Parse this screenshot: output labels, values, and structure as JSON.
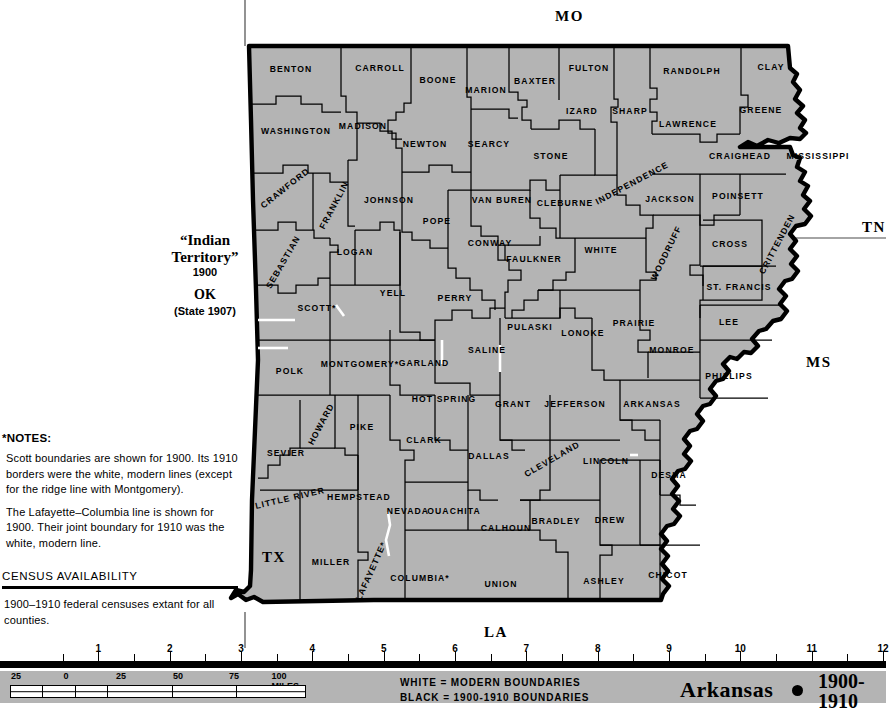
{
  "map": {
    "title": "Arkansas",
    "period": "1900-1910",
    "period_line1": "1900-",
    "period_line2": "1910",
    "fill_color": "#b4b4b4",
    "boundary_color": "#000000",
    "modern_line_color": "#ffffff",
    "legend": {
      "line1": "WHITE = MODERN BOUNDARIES",
      "line2": "BLACK = 1900-1910 BOUNDARIES"
    },
    "neighbor_states": [
      {
        "label": "MO",
        "x": 555,
        "y": 8
      },
      {
        "label": "TN",
        "x": 862,
        "y": 219
      },
      {
        "label": "MS",
        "x": 806,
        "y": 354
      },
      {
        "label": "TX",
        "x": 262,
        "y": 549
      },
      {
        "label": "LA",
        "x": 484,
        "y": 624
      }
    ],
    "indian_territory": {
      "line1": "“Indian",
      "line2": "Territory”",
      "year": "1900",
      "abbrev": "OK",
      "statehood": "(State 1907)"
    },
    "counties": [
      {
        "name": "BENTON",
        "x": 291,
        "y": 69,
        "rot": 0
      },
      {
        "name": "CARROLL",
        "x": 380,
        "y": 68,
        "rot": 0
      },
      {
        "name": "BOONE",
        "x": 438,
        "y": 80,
        "rot": 0
      },
      {
        "name": "MARION",
        "x": 486,
        "y": 90,
        "rot": 0
      },
      {
        "name": "BAXTER",
        "x": 535,
        "y": 81,
        "rot": 0
      },
      {
        "name": "FULTON",
        "x": 589,
        "y": 68,
        "rot": 0
      },
      {
        "name": "RANDOLPH",
        "x": 692,
        "y": 71,
        "rot": 0
      },
      {
        "name": "CLAY",
        "x": 771,
        "y": 67,
        "rot": 0
      },
      {
        "name": "WASHINGTON",
        "x": 296,
        "y": 131,
        "rot": 0
      },
      {
        "name": "MADISON",
        "x": 363,
        "y": 126,
        "rot": 0
      },
      {
        "name": "NEWTON",
        "x": 425,
        "y": 144,
        "rot": 0
      },
      {
        "name": "SEARCY",
        "x": 489,
        "y": 144,
        "rot": 0
      },
      {
        "name": "STONE",
        "x": 551,
        "y": 156,
        "rot": 0
      },
      {
        "name": "IZARD",
        "x": 582,
        "y": 111,
        "rot": 0
      },
      {
        "name": "SHARP",
        "x": 630,
        "y": 111,
        "rot": 0
      },
      {
        "name": "LAWRENCE",
        "x": 688,
        "y": 124,
        "rot": 0
      },
      {
        "name": "GREENE",
        "x": 761,
        "y": 110,
        "rot": 0
      },
      {
        "name": "CRAIGHEAD",
        "x": 740,
        "y": 156,
        "rot": 0
      },
      {
        "name": "MISSISSIPPI",
        "x": 818,
        "y": 156,
        "rot": 0
      },
      {
        "name": "CRAWFORD",
        "x": 285,
        "y": 188,
        "rot": -38
      },
      {
        "name": "FRANKLIN",
        "x": 334,
        "y": 205,
        "rot": -62
      },
      {
        "name": "JOHNSON",
        "x": 389,
        "y": 200,
        "rot": 0
      },
      {
        "name": "VAN BUREN",
        "x": 502,
        "y": 200,
        "rot": 0
      },
      {
        "name": "CLEBURNE",
        "x": 565,
        "y": 203,
        "rot": 0
      },
      {
        "name": "INDEPENDENCE",
        "x": 632,
        "y": 183,
        "rot": -28
      },
      {
        "name": "JACKSON",
        "x": 670,
        "y": 199,
        "rot": 0
      },
      {
        "name": "POINSETT",
        "x": 738,
        "y": 196,
        "rot": 0
      },
      {
        "name": "POPE",
        "x": 437,
        "y": 221,
        "rot": 0
      },
      {
        "name": "SEBASTIAN",
        "x": 283,
        "y": 262,
        "rot": -60
      },
      {
        "name": "LOGAN",
        "x": 355,
        "y": 252,
        "rot": 0
      },
      {
        "name": "CONWAY",
        "x": 490,
        "y": 243,
        "rot": 0
      },
      {
        "name": "FAULKNER",
        "x": 534,
        "y": 259,
        "rot": 0
      },
      {
        "name": "WHITE",
        "x": 601,
        "y": 250,
        "rot": 0
      },
      {
        "name": "WOODRUFF",
        "x": 666,
        "y": 253,
        "rot": -64
      },
      {
        "name": "CROSS",
        "x": 730,
        "y": 244,
        "rot": 0
      },
      {
        "name": "CRITTENDEN",
        "x": 777,
        "y": 244,
        "rot": -62
      },
      {
        "name": "YELL",
        "x": 393,
        "y": 293,
        "rot": 0
      },
      {
        "name": "PERRY",
        "x": 455,
        "y": 298,
        "rot": 0
      },
      {
        "name": "SCOTT*",
        "x": 317,
        "y": 308,
        "rot": 0
      },
      {
        "name": "ST. FRANCIS",
        "x": 739,
        "y": 287,
        "rot": 0
      },
      {
        "name": "PULASKI",
        "x": 530,
        "y": 327,
        "rot": 0
      },
      {
        "name": "LONOKE",
        "x": 583,
        "y": 333,
        "rot": 0
      },
      {
        "name": "PRAIRIE",
        "x": 634,
        "y": 323,
        "rot": 0
      },
      {
        "name": "LEE",
        "x": 729,
        "y": 322,
        "rot": 0
      },
      {
        "name": "MONROE",
        "x": 672,
        "y": 350,
        "rot": 0
      },
      {
        "name": "SALINE",
        "x": 487,
        "y": 350,
        "rot": 0
      },
      {
        "name": "GARLAND",
        "x": 424,
        "y": 363,
        "rot": 0
      },
      {
        "name": "MONTGOMERY*",
        "x": 360,
        "y": 364,
        "rot": 0
      },
      {
        "name": "POLK",
        "x": 290,
        "y": 371,
        "rot": 0
      },
      {
        "name": "PHILLIPS",
        "x": 729,
        "y": 376,
        "rot": 0
      },
      {
        "name": "HOT SPRING",
        "x": 444,
        "y": 399,
        "rot": 0
      },
      {
        "name": "GRANT",
        "x": 513,
        "y": 404,
        "rot": 0
      },
      {
        "name": "JEFFERSON",
        "x": 575,
        "y": 404,
        "rot": 0
      },
      {
        "name": "ARKANSAS",
        "x": 652,
        "y": 404,
        "rot": 0
      },
      {
        "name": "HOWARD",
        "x": 321,
        "y": 424,
        "rot": -62
      },
      {
        "name": "PIKE",
        "x": 362,
        "y": 427,
        "rot": 0
      },
      {
        "name": "CLARK",
        "x": 424,
        "y": 440,
        "rot": 0
      },
      {
        "name": "DALLAS",
        "x": 489,
        "y": 456,
        "rot": 0
      },
      {
        "name": "CLEVELAND",
        "x": 552,
        "y": 459,
        "rot": -30
      },
      {
        "name": "LINCOLN",
        "x": 606,
        "y": 461,
        "rot": 0
      },
      {
        "name": "SEVIER",
        "x": 286,
        "y": 453,
        "rot": 0
      },
      {
        "name": "LITTLE RIVER",
        "x": 290,
        "y": 498,
        "rot": -13
      },
      {
        "name": "HEMPSTEAD",
        "x": 359,
        "y": 497,
        "rot": 0
      },
      {
        "name": "NEVADA",
        "x": 408,
        "y": 511,
        "rot": 0
      },
      {
        "name": "OUACHITA",
        "x": 454,
        "y": 511,
        "rot": 0
      },
      {
        "name": "CALHOUN",
        "x": 506,
        "y": 528,
        "rot": 0
      },
      {
        "name": "BRADLEY",
        "x": 556,
        "y": 521,
        "rot": 0
      },
      {
        "name": "DREW",
        "x": 610,
        "y": 520,
        "rot": 0
      },
      {
        "name": "DESHA",
        "x": 669,
        "y": 475,
        "rot": 0
      },
      {
        "name": "MILLER",
        "x": 331,
        "y": 562,
        "rot": 0
      },
      {
        "name": "LAFAYETTE*",
        "x": 371,
        "y": 571,
        "rot": -66
      },
      {
        "name": "COLUMBIA*",
        "x": 420,
        "y": 578,
        "rot": 0
      },
      {
        "name": "UNION",
        "x": 501,
        "y": 584,
        "rot": 0
      },
      {
        "name": "ASHLEY",
        "x": 604,
        "y": 581,
        "rot": 0
      },
      {
        "name": "CHICOT",
        "x": 668,
        "y": 575,
        "rot": 0
      }
    ]
  },
  "notes": {
    "title": "*NOTES:",
    "p1": "Scott boundaries are shown for 1900.  Its 1910 borders were the white, modern lines (except for the ridge line with Montgomery).",
    "p2": "The Lafayette–Columbia line is shown for 1900.  Their joint boundary for 1910 was the white, modern line."
  },
  "census": {
    "title": "CENSUS AVAILABILITY",
    "text": "1900–1910 federal censuses extant for all counties."
  },
  "ruler": {
    "numbers": [
      "1",
      "2",
      "3",
      "4",
      "5",
      "6",
      "7",
      "8",
      "9",
      "10",
      "11",
      "12"
    ]
  },
  "scalebar": {
    "numbers": [
      "25",
      "0",
      "25",
      "50",
      "75",
      "100 MILES"
    ]
  }
}
